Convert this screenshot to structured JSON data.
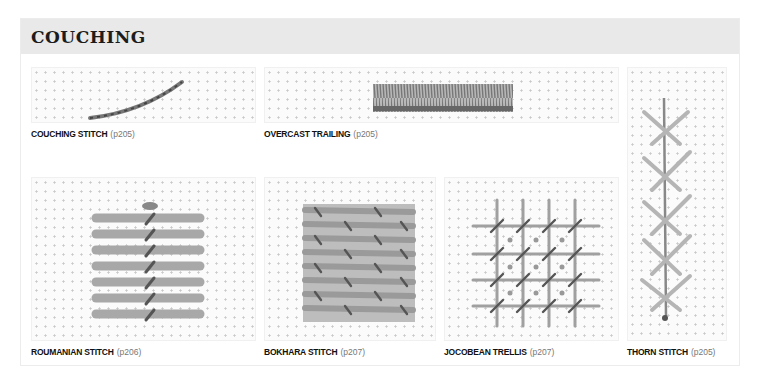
{
  "section": {
    "title": "COUCHING"
  },
  "stitches": [
    {
      "name": "COUCHING STITCH",
      "page": "(p205)"
    },
    {
      "name": "OVERCAST TRAILING",
      "page": "(p205)"
    },
    {
      "name": "ROUMANIAN STITCH",
      "page": "(p206)"
    },
    {
      "name": "BOKHARA STITCH",
      "page": "(p207)"
    },
    {
      "name": "JOCOBEAN TRELLIS",
      "page": "(p207)"
    },
    {
      "name": "THORN STITCH",
      "page": "(p205)"
    }
  ],
  "colors": {
    "header_bg": "#e9e9e9",
    "thread": "#9a9a9a",
    "thread_dark": "#555555"
  }
}
